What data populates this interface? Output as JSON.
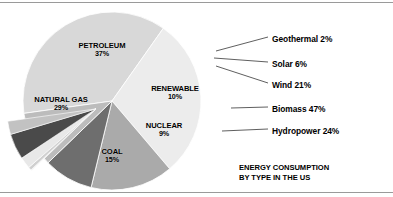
{
  "caption": {
    "line1": "ENERGY CONSUMPTION",
    "line2": "BY TYPE IN THE US"
  },
  "chart_data": {
    "type": "pie",
    "title": "ENERGY CONSUMPTION BY TYPE IN THE US",
    "subtitle": "",
    "xlabel": "",
    "ylabel": "",
    "grid": false,
    "legend_position": "right",
    "units": "percent",
    "categories": [
      "PETROLEUM",
      "NATURAL GAS",
      "COAL",
      "NUCLEAR",
      "RENEWABLE"
    ],
    "values": [
      37,
      29,
      15,
      9,
      10
    ],
    "labels": [
      "37%",
      "29%",
      "15%",
      "9%",
      "10%"
    ],
    "colors": [
      "#d8d8d8",
      "#ececec",
      "#aaaaaa",
      "#6e6e6e",
      "#bcbcbc"
    ],
    "exploded_from": "RENEWABLE",
    "breakdown": {
      "title": "RENEWABLE",
      "categories": [
        "Geothermal",
        "Solar",
        "Wind",
        "Biomass",
        "Hydropower"
      ],
      "values": [
        2,
        6,
        21,
        47,
        24
      ],
      "labels": [
        "Geothermal 2%",
        "Solar 6%",
        "Wind 21%",
        "Biomass 47%",
        "Hydropower 24%"
      ],
      "colors": [
        "#f2f2f2",
        "#d0d0d0",
        "#e8e8e8",
        "#4a4a4a",
        "#c2c2c2"
      ]
    },
    "slices": [
      {
        "name": "PETROLEUM",
        "percent": 37,
        "percent_label": "37%",
        "color": "#d8d8d8"
      },
      {
        "name": "NATURAL GAS",
        "percent": 29,
        "percent_label": "29%",
        "color": "#ececec"
      },
      {
        "name": "COAL",
        "percent": 15,
        "percent_label": "15%",
        "color": "#aaaaaa"
      },
      {
        "name": "NUCLEAR",
        "percent": 9,
        "percent_label": "9%",
        "color": "#6e6e6e"
      },
      {
        "name": "RENEWABLE",
        "percent": 10,
        "percent_label": "10%",
        "color": "#bcbcbc"
      }
    ],
    "callouts": [
      {
        "name": "Geothermal",
        "percent": 2,
        "label": "Geothermal 2%",
        "color": "#f2f2f2"
      },
      {
        "name": "Solar",
        "percent": 6,
        "label": "Solar 6%",
        "color": "#d0d0d0"
      },
      {
        "name": "Wind",
        "percent": 21,
        "label": "Wind 21%",
        "color": "#e8e8e8"
      },
      {
        "name": "Biomass",
        "percent": 47,
        "label": "Biomass 47%",
        "color": "#4a4a4a"
      },
      {
        "name": "Hydropower",
        "percent": 24,
        "label": "Hydropower 24%",
        "color": "#c2c2c2"
      }
    ]
  }
}
